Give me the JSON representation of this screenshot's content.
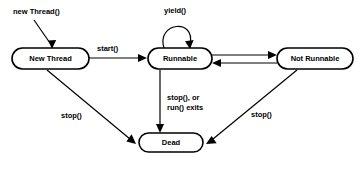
{
  "diagram": {
    "background_color": "#ffffff",
    "stroke_color": "#000000",
    "states": [
      {
        "id": "new-thread",
        "label": "New Thread",
        "x": 12,
        "y": 48,
        "w": 77,
        "h": 21
      },
      {
        "id": "runnable",
        "label": "Runnable",
        "x": 148,
        "y": 48,
        "w": 64,
        "h": 21
      },
      {
        "id": "not-runnable",
        "label": "Not Runnable",
        "x": 277,
        "y": 48,
        "w": 76,
        "h": 21
      },
      {
        "id": "dead",
        "label": "Dead",
        "x": 139,
        "y": 133,
        "w": 64,
        "h": 19
      }
    ],
    "edge_labels": [
      {
        "id": "new-thread-call",
        "text": "new Thread()",
        "x": 13,
        "y": 14
      },
      {
        "id": "start-call",
        "text": "start()",
        "x": 97,
        "y": 51
      },
      {
        "id": "yield-call",
        "text": "yield()",
        "x": 164,
        "y": 13
      },
      {
        "id": "stop-left",
        "text": "stop()",
        "x": 61,
        "y": 118
      },
      {
        "id": "stop-or-run-1",
        "text": "stop(), or",
        "x": 167,
        "y": 100
      },
      {
        "id": "stop-or-run-2",
        "text": "run() exits",
        "x": 167,
        "y": 110
      },
      {
        "id": "stop-right",
        "text": "stop()",
        "x": 251,
        "y": 117
      }
    ]
  }
}
